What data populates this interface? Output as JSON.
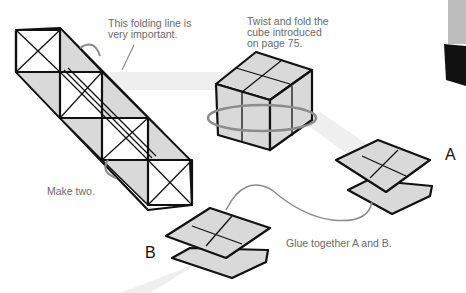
{
  "captions": {
    "folding_line": "This folding line is\nvery important.",
    "twist_fold": "Twist and fold the\ncube introduced\non page 75.",
    "make_two": "Make two.",
    "glue": "Glue together A and B."
  },
  "labels": {
    "a": "A",
    "b": "B"
  },
  "colors": {
    "paper_fill": "#d9d9d9",
    "outline": "#111111",
    "arrow": "#8c8c8c",
    "flow_band": "#efefef",
    "caption_text": "#6a6a6a"
  }
}
